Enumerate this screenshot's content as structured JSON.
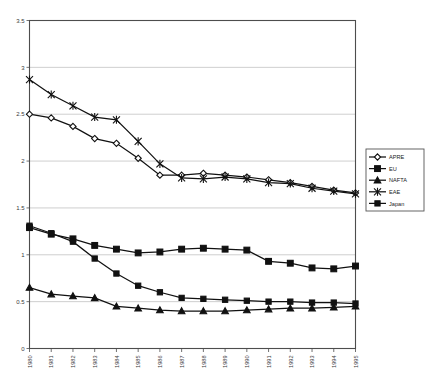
{
  "chart_data": {
    "type": "line",
    "title": "",
    "subtitle": "",
    "xlabel": "",
    "ylabel": "",
    "grid": true,
    "legend_position": "right",
    "xlim": [
      1980,
      1995
    ],
    "ylim": [
      0,
      3.5
    ],
    "ytick_labels": [
      "0",
      "0.5",
      "1",
      "1.5",
      "2",
      "2.5",
      "3",
      "3.5"
    ],
    "ytick_values": [
      0,
      0.5,
      1,
      1.5,
      2,
      2.5,
      3,
      3.5
    ],
    "categories": [
      "1980",
      "1981",
      "1982",
      "1983",
      "1984",
      "1985",
      "1986",
      "1987",
      "1988",
      "1989",
      "1990",
      "1991",
      "1992",
      "1993",
      "1994",
      "1995"
    ],
    "series": [
      {
        "name": "APRE",
        "marker": "open-diamond",
        "values": [
          2.5,
          2.46,
          2.37,
          2.24,
          2.19,
          2.03,
          1.85,
          1.85,
          1.87,
          1.85,
          1.83,
          1.8,
          1.77,
          1.73,
          1.69,
          1.66
        ]
      },
      {
        "name": "EU",
        "marker": "solid-square",
        "values": [
          1.29,
          1.22,
          1.17,
          1.1,
          1.06,
          1.02,
          1.03,
          1.06,
          1.07,
          1.06,
          1.05,
          0.93,
          0.91,
          0.86,
          0.85,
          0.88
        ]
      },
      {
        "name": "NAFTA",
        "marker": "solid-triangle",
        "values": [
          0.65,
          0.58,
          0.56,
          0.54,
          0.45,
          0.43,
          0.41,
          0.4,
          0.4,
          0.4,
          0.41,
          0.42,
          0.43,
          0.43,
          0.44,
          0.45
        ]
      },
      {
        "name": "EAE",
        "marker": "star",
        "values": [
          2.87,
          2.71,
          2.59,
          2.47,
          2.44,
          2.21,
          1.97,
          1.82,
          1.81,
          1.83,
          1.81,
          1.77,
          1.76,
          1.71,
          1.68,
          1.65
        ]
      },
      {
        "name": "Japan",
        "marker": "solid-square-small",
        "values": [
          1.31,
          1.23,
          1.14,
          0.96,
          0.8,
          0.67,
          0.6,
          0.54,
          0.53,
          0.52,
          0.51,
          0.5,
          0.5,
          0.49,
          0.49,
          0.48
        ]
      }
    ],
    "legend_entries": [
      "APRE",
      "EU",
      "NAFTA",
      "EAE",
      "Japan"
    ]
  },
  "colors": {
    "line": "#111111",
    "grid": "#b9b9b9",
    "axis": "#4d4d4d",
    "background": "#ffffff"
  }
}
